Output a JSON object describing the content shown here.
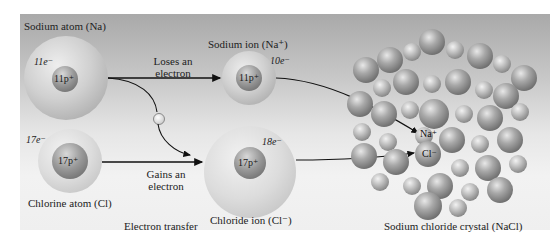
{
  "sodium_atom": {
    "label": "Sodium atom (Na)",
    "electrons": "11e⁻",
    "nucleus": "11p⁺"
  },
  "chlorine_atom": {
    "label": "Chlorine atom (Cl)",
    "electrons": "17e⁻",
    "nucleus": "17p⁺"
  },
  "sodium_ion": {
    "label": "Sodium ion (Na⁺)",
    "electrons": "10e⁻",
    "nucleus": "11p⁺"
  },
  "chloride_ion": {
    "label": "Chloride ion (Cl⁻)",
    "electrons": "18e⁻",
    "nucleus": "17p⁺"
  },
  "arrows": {
    "loses": {
      "line1": "Loses an",
      "line2": "electron"
    },
    "gains": {
      "line1": "Gains an",
      "line2": "electron"
    },
    "transfer": "Electron transfer",
    "electron_symbol": "e⁻"
  },
  "crystal": {
    "label": "Sodium chloride crystal (NaCl)",
    "na_label": "Na⁺",
    "cl_label": "Cl⁻"
  },
  "colors": {
    "background_top": "#a9a9a9",
    "background_bottom": "#f0f0f0",
    "sphere": "#b0b0b0",
    "arrow": "#111111"
  }
}
